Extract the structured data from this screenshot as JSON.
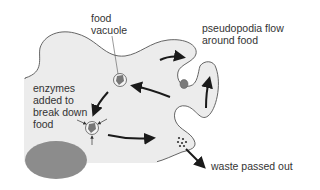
{
  "diagram": {
    "labels": {
      "food_vacuole": "food\nvacuole",
      "pseudopodia": "pseudopodia flow\naround food",
      "enzymes": "enzymes\nadded to\nbreak down\nfood",
      "waste": "waste passed out"
    },
    "colors": {
      "cytoplasm": "#ececec",
      "outline": "#555555",
      "nucleus": "#8c8c8c",
      "vacuole": "#7a7a7a",
      "arrow": "#1a1a1a",
      "text": "#333333",
      "background": "#ffffff"
    },
    "parts": [
      "cell membrane",
      "cytoplasm",
      "nucleus",
      "food particle",
      "food vacuole",
      "digesting vacuole",
      "waste vacuole",
      "pseudopodia"
    ]
  }
}
